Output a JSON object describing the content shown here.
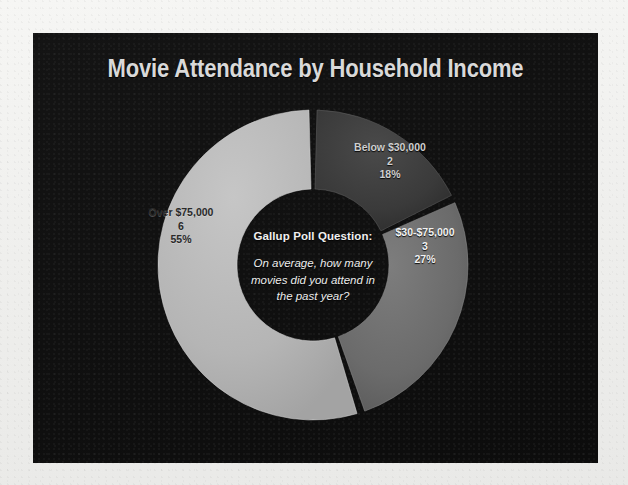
{
  "page": {
    "background_color": "#eeeeec",
    "panel_color": "#111111"
  },
  "header": {
    "title": "Movie Attendance by Household Income"
  },
  "center": {
    "heading": "Gallup Poll Question:",
    "body_line1": "On average, how many",
    "body_line2": "movies did you attend in",
    "body_line3": "the past year?"
  },
  "labels": {
    "below": {
      "name": "Below $30,000",
      "value": "2",
      "percent": "18%"
    },
    "mid": {
      "name": "$30-$75,000",
      "value": "3",
      "percent": "27%"
    },
    "over": {
      "name": "Over $75,000",
      "value": "6",
      "percent": "55%"
    }
  },
  "chart_data": {
    "type": "pie",
    "variant": "donut",
    "title": "Movie Attendance by Household Income",
    "categories": [
      "Below $30,000",
      "$30-$75,000",
      "Over $75,000"
    ],
    "values": [
      2,
      3,
      6
    ],
    "percentages": [
      18,
      27,
      55
    ],
    "value_label": "Average movies attended in past year",
    "colors": [
      "#3a3a3a",
      "#6b6b6b",
      "#b5b5b5"
    ],
    "legend": "none",
    "labels_position": "inside-slice",
    "start_angle": 0,
    "direction": "clockwise",
    "center_x": 313,
    "center_y": 265,
    "outer_radius": 155,
    "inner_radius": 76,
    "slice_gap_degrees": 3,
    "annotations": [
      "Gallup Poll Question:",
      "On average, how many movies did you attend in the past year?"
    ]
  }
}
